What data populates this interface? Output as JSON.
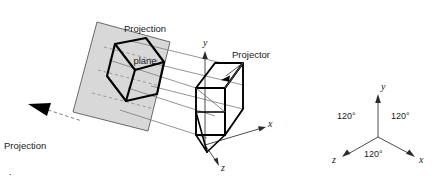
{
  "figure": {
    "title_left": "Projection plane / isometric projection of a cube",
    "background_color": "#ffffff",
    "plane_fill": "#d9d9d9",
    "plane_stroke": "#555555",
    "solid_stroke": "#000000",
    "ray_stroke": "#777777",
    "dashed_stroke": "#8c8c8c"
  },
  "labels": {
    "projection_plane": {
      "line1": "Projection",
      "line2": "plane"
    },
    "projector": "Projector",
    "projection_plane_normal": {
      "line1": "Projection",
      "line2": "plane",
      "line3": "normal"
    }
  },
  "scene_axes": {
    "x": "x",
    "y": "y",
    "z": "z"
  },
  "isometric_triad": {
    "axes": {
      "x": "x",
      "y": "y",
      "z": "z"
    },
    "angles": {
      "left": "120°",
      "right": "120°",
      "bottom": "120°"
    }
  }
}
